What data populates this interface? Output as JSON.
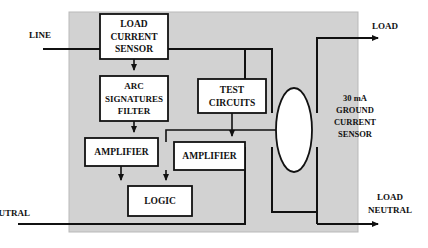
{
  "diagram": {
    "panel": {
      "fill": "#d2d2d2",
      "stroke": "#b9b9b9"
    },
    "colors": {
      "background": "#ffffff",
      "panel_gray": "#d2d2d2",
      "box_fill": "#ffffff",
      "line": "#111111",
      "text": "#111111"
    },
    "blocks": [
      {
        "id": "load-current-sensor",
        "lines": [
          "LOAD",
          "CURRENT",
          "SENSOR"
        ],
        "x": 100,
        "y": 14,
        "w": 68,
        "h": 45,
        "font_size": 9.5,
        "line_height": 12.5
      },
      {
        "id": "arc-signatures-filter",
        "lines": [
          "ARC",
          "SIGNATURES",
          "FILTER"
        ],
        "x": 100,
        "y": 76,
        "w": 68,
        "h": 45,
        "font_size": 9,
        "line_height": 12.5
      },
      {
        "id": "test-circuits",
        "lines": [
          "TEST",
          "CIRCUITS"
        ],
        "x": 198,
        "y": 79,
        "w": 68,
        "h": 34,
        "font_size": 9.5,
        "line_height": 13
      },
      {
        "id": "amplifier-left",
        "lines": [
          "AMPLIFIER"
        ],
        "x": 85,
        "y": 138,
        "w": 73,
        "h": 28,
        "font_size": 9.5,
        "line_height": 13
      },
      {
        "id": "amplifier-right",
        "lines": [
          "AMPLIFIER"
        ],
        "x": 174,
        "y": 142,
        "w": 71,
        "h": 28,
        "font_size": 9.5,
        "line_height": 13
      },
      {
        "id": "logic",
        "lines": [
          "LOGIC"
        ],
        "x": 128,
        "y": 186,
        "w": 64,
        "h": 30,
        "font_size": 9.5,
        "line_height": 13
      }
    ],
    "ground_sensor": {
      "id": "ground-current-sensor",
      "lines": [
        "30 mA",
        "GROUND",
        "CURRENT",
        "SENSOR"
      ],
      "center_x": 355,
      "start_y": 101,
      "line_height": 12
    },
    "toroid": {
      "id": "ground-current-transformer-core",
      "cx": 294,
      "cy": 130,
      "rx": 18,
      "ry": 42
    },
    "terminals": [
      {
        "id": "line-terminal",
        "label": "LINE",
        "x": 40,
        "y": 38,
        "anchor": "start"
      },
      {
        "id": "neutral-terminal",
        "label": "NEUTRAL",
        "x": 8,
        "y": 216,
        "anchor": "start"
      },
      {
        "id": "load-terminal",
        "label": "LOAD",
        "x": 385,
        "y": 29,
        "anchor": "middle"
      },
      {
        "id": "load-neutral-terminal-line1",
        "label": "LOAD",
        "x": 390,
        "y": 200,
        "anchor": "middle"
      },
      {
        "id": "load-neutral-terminal-line2",
        "label": "NEUTRAL",
        "x": 390,
        "y": 213,
        "anchor": "middle"
      }
    ]
  }
}
